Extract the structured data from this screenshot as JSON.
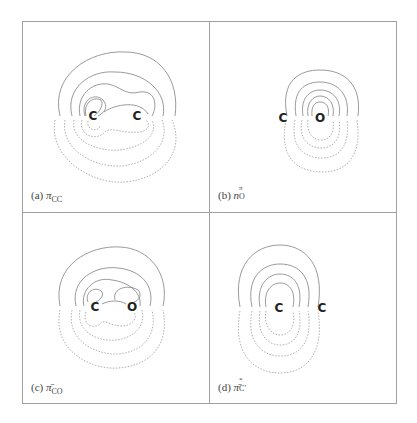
{
  "figure": {
    "layout": "2x2 grid of orbital contour plots",
    "frame_color": "#9a9a9a",
    "contour_color_positive": "#7a7a7a",
    "contour_color_negative": "#9a9a9a",
    "atom_color": "#222222",
    "panels": [
      {
        "id": "a",
        "label_prefix": "(a)",
        "orbital_symbol": "π",
        "subscript": "CC",
        "superscript": "",
        "atoms": [
          {
            "symbol": "C",
            "x": 93,
            "y": 116
          },
          {
            "symbol": "C",
            "x": 137,
            "y": 116
          }
        ]
      },
      {
        "id": "b",
        "label_prefix": "(b)",
        "orbital_symbol": "n",
        "subscript": "O",
        "superscript": "π",
        "atoms": [
          {
            "symbol": "C",
            "x": 283,
            "y": 117
          },
          {
            "symbol": "O",
            "x": 320,
            "y": 117
          }
        ]
      },
      {
        "id": "c",
        "label_prefix": "(c)",
        "orbital_symbol": "π̄",
        "subscript": "CO",
        "superscript": "",
        "atoms": [
          {
            "symbol": "C",
            "x": 95,
            "y": 307
          },
          {
            "symbol": "O",
            "x": 132,
            "y": 307
          }
        ]
      },
      {
        "id": "d",
        "label_prefix": "(d)",
        "orbital_symbol": "π̄",
        "subscript": "C'",
        "superscript": "*",
        "atoms": [
          {
            "symbol": "C",
            "x": 279,
            "y": 308
          },
          {
            "symbol": "C",
            "x": 322,
            "y": 308
          }
        ]
      }
    ]
  }
}
